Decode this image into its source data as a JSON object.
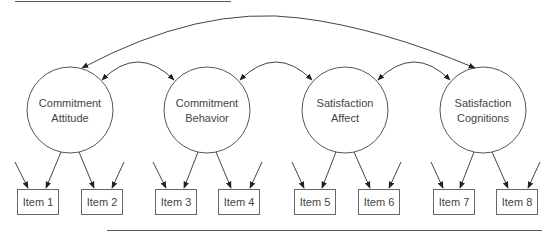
{
  "diagram": {
    "type": "structural-equation-model",
    "latent_factors": [
      {
        "id": "f1",
        "line1": "Commitment",
        "line2": "Attitude",
        "cx": 70,
        "cy": 110
      },
      {
        "id": "f2",
        "line1": "Commitment",
        "line2": "Behavior",
        "cx": 207,
        "cy": 110
      },
      {
        "id": "f3",
        "line1": "Satisfaction",
        "line2": "Affect",
        "cx": 345,
        "cy": 110
      },
      {
        "id": "f4",
        "line1": "Satisfaction",
        "line2": "Cognitions",
        "cx": 483,
        "cy": 110
      }
    ],
    "indicators": [
      {
        "label": "Item 1",
        "factor": "f1",
        "x": 17
      },
      {
        "label": "Item 2",
        "factor": "f1",
        "x": 81
      },
      {
        "label": "Item 3",
        "factor": "f2",
        "x": 155
      },
      {
        "label": "Item 4",
        "factor": "f2",
        "x": 218
      },
      {
        "label": "Item 5",
        "factor": "f3",
        "x": 294
      },
      {
        "label": "Item 6",
        "factor": "f3",
        "x": 358
      },
      {
        "label": "Item 7",
        "factor": "f4",
        "x": 433
      },
      {
        "label": "Item 8",
        "factor": "f4",
        "x": 496
      }
    ],
    "covariances": [
      [
        "f1",
        "f2"
      ],
      [
        "f2",
        "f3"
      ],
      [
        "f3",
        "f4"
      ],
      [
        "f1",
        "f4"
      ]
    ],
    "error_terms_per_item": 1,
    "colors": {
      "stroke": "#555555",
      "text": "#444444",
      "background": "#ffffff"
    }
  }
}
